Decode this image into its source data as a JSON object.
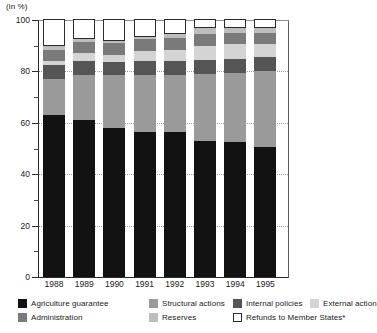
{
  "chart_data": {
    "type": "bar",
    "subtype": "stacked-percentage",
    "title": "",
    "unit_label": "(in %)",
    "xlabel": "",
    "ylabel": "",
    "ylim": [
      0,
      100
    ],
    "ytick_labels": [
      "0",
      "20",
      "40",
      "60",
      "80",
      "100"
    ],
    "ytick_values": [
      0,
      20,
      40,
      60,
      80,
      100
    ],
    "yminor_values": [
      10,
      30,
      50,
      70,
      90
    ],
    "gridlines": [
      20,
      40,
      60,
      80
    ],
    "grid": true,
    "legend_position": "bottom",
    "categories": [
      "1988",
      "1989",
      "1990",
      "1991",
      "1992",
      "1993",
      "1994",
      "1995"
    ],
    "series": [
      {
        "name": "Agriculture guarantee",
        "color": "#121212",
        "outlined": false,
        "values": [
          63.0,
          61.0,
          58.0,
          56.5,
          56.5,
          53.0,
          52.5,
          50.5
        ]
      },
      {
        "name": "Structural actions",
        "color": "#9a9a9a",
        "outlined": false,
        "values": [
          14.0,
          17.5,
          20.5,
          22.0,
          22.0,
          26.0,
          27.0,
          29.5
        ]
      },
      {
        "name": "Internal policies",
        "color": "#555555",
        "outlined": false,
        "values": [
          5.5,
          5.5,
          5.0,
          5.5,
          5.5,
          5.5,
          5.5,
          5.5
        ]
      },
      {
        "name": "External action",
        "color": "#d4d4d4",
        "outlined": false,
        "values": [
          1.5,
          3.0,
          3.0,
          4.0,
          4.5,
          5.5,
          5.5,
          5.0
        ]
      },
      {
        "name": "Administration",
        "color": "#7a7a7a",
        "outlined": false,
        "values": [
          4.5,
          4.5,
          4.5,
          4.5,
          4.5,
          4.5,
          4.5,
          4.5
        ]
      },
      {
        "name": "Reserves",
        "color": "#bdbdbd",
        "outlined": false,
        "values": [
          1.5,
          1.0,
          1.0,
          1.0,
          1.5,
          2.5,
          2.0,
          2.0
        ]
      },
      {
        "name": "Refunds to Member States*",
        "color": "#ffffff",
        "outlined": true,
        "values": [
          10.0,
          7.5,
          8.0,
          6.5,
          5.5,
          3.0,
          3.0,
          3.0
        ]
      }
    ]
  },
  "legend": {
    "rows": [
      [
        {
          "label": "Agriculture guarantee",
          "color": "#121212",
          "outlined": false,
          "x": 0,
          "w": 130
        },
        {
          "label": "Structural actions",
          "color": "#9a9a9a",
          "outlined": false,
          "x": 131,
          "w": 110
        },
        {
          "label": "Internal policies",
          "color": "#555555",
          "outlined": false,
          "x": 215,
          "w": 110
        },
        {
          "label": "External action",
          "color": "#d4d4d4",
          "outlined": false,
          "x": 292,
          "w": 110
        }
      ],
      [
        {
          "label": "Administration",
          "color": "#7a7a7a",
          "outlined": false,
          "x": 0,
          "w": 110
        },
        {
          "label": "Reserves",
          "color": "#bdbdbd",
          "outlined": false,
          "x": 131,
          "w": 110
        },
        {
          "label": "Refunds to Member States*",
          "color": "#ffffff",
          "outlined": true,
          "x": 215,
          "w": 150
        }
      ]
    ]
  }
}
